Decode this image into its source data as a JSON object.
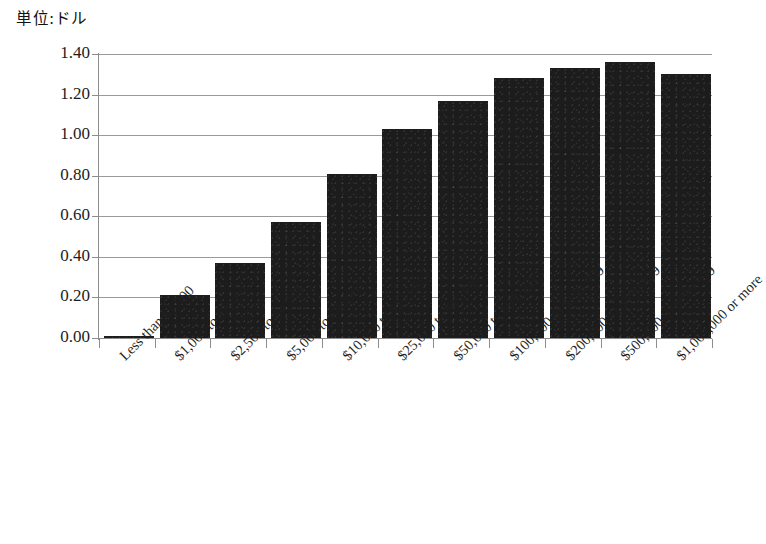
{
  "chart_data": {
    "type": "bar",
    "title": "単位:ドル",
    "xlabel": "",
    "ylabel": "",
    "ylim": [
      0.0,
      1.4
    ],
    "ytick_labels": [
      "1.40",
      "1.20",
      "1.00",
      "0.80",
      "0.60",
      "0.40",
      "0.20",
      "0.00"
    ],
    "ytick_values": [
      1.4,
      1.2,
      1.0,
      0.8,
      0.6,
      0.4,
      0.2,
      0.0
    ],
    "grid": true,
    "legend": false,
    "bar_color": "#1c1c1c",
    "axis_color": "#8d8d8d",
    "categories": [
      "Less than $1,000",
      "$1,000 to $2,499",
      "$2,500 to $4,999",
      "$5,000 to $9,999",
      "$10,000 to $24,999",
      "$25,000 to $49,999",
      "$50,000 to $99,999",
      "$100,000 to $199,999",
      "$200,000 to $499,999",
      "$500,000 to $999,999",
      "$1,000,000 or more"
    ],
    "values": [
      0.01,
      0.21,
      0.37,
      0.57,
      0.81,
      1.03,
      1.17,
      1.28,
      1.33,
      1.36,
      1.3
    ]
  }
}
